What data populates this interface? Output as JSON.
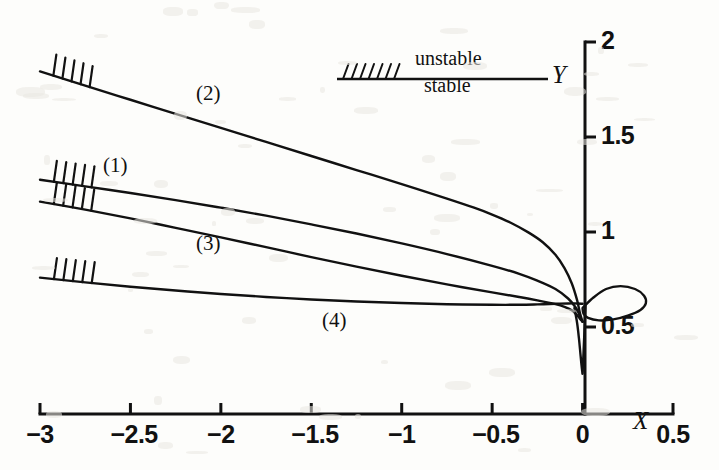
{
  "figure": {
    "background_color": "#fdfdfb",
    "ink_color": "#111111",
    "axis_labels": {
      "x": "X",
      "y": "Y"
    }
  },
  "legend": {
    "unstable_label": "unstable",
    "stable_label": "stable",
    "hatch_marks": 7
  },
  "curve_labels": [
    {
      "text": "(1)",
      "x": 103,
      "y": 155
    },
    {
      "text": "(2)",
      "x": 196,
      "y": 83
    },
    {
      "text": "(3)",
      "x": 196,
      "y": 233
    },
    {
      "text": "(4)",
      "x": 322,
      "y": 310
    }
  ],
  "chart_data": {
    "type": "line",
    "title": "",
    "xlabel": "X",
    "ylabel": "Y",
    "xlim": [
      -3,
      0.5
    ],
    "ylim": [
      0,
      2
    ],
    "xticks": [
      -3,
      -2.5,
      -2,
      -1.5,
      -1,
      -0.5,
      0,
      0.5
    ],
    "xtick_labels": [
      "-3",
      "-2.5",
      "-2",
      "-1.5",
      "-1",
      "-0.5",
      "0",
      "0.5"
    ],
    "yticks": [
      0.5,
      1,
      1.5,
      2
    ],
    "ytick_labels": [
      "0.5",
      "1",
      "1.5",
      "2"
    ],
    "grid": false,
    "legend_position": "top-center",
    "stability_encoding": {
      "unstable": "line with hatch ticks",
      "stable": "plain line"
    },
    "series": [
      {
        "name": "(1)",
        "stability": "unstable-at-left",
        "unstable_range_x": [
          -3.0,
          -2.72
        ],
        "points": [
          [
            -3.0,
            1.275
          ],
          [
            -2.75,
            1.24
          ],
          [
            -2.5,
            1.205
          ],
          [
            -2.25,
            1.168
          ],
          [
            -2.0,
            1.128
          ],
          [
            -1.75,
            1.086
          ],
          [
            -1.5,
            1.04
          ],
          [
            -1.25,
            0.992
          ],
          [
            -1.0,
            0.94
          ],
          [
            -0.75,
            0.884
          ],
          [
            -0.5,
            0.822
          ],
          [
            -0.35,
            0.78
          ],
          [
            -0.25,
            0.744
          ],
          [
            -0.15,
            0.7
          ],
          [
            -0.08,
            0.65
          ],
          [
            -0.04,
            0.605
          ],
          [
            -0.02,
            0.57
          ],
          [
            -0.01,
            0.545
          ],
          [
            0.0,
            0.528
          ]
        ]
      },
      {
        "name": "(2)",
        "stability": "unstable-at-left",
        "unstable_range_x": [
          -3.0,
          -2.7
        ],
        "points": [
          [
            -3.0,
            1.845
          ],
          [
            -2.75,
            1.77
          ],
          [
            -2.5,
            1.696
          ],
          [
            -2.25,
            1.622
          ],
          [
            -2.0,
            1.548
          ],
          [
            -1.75,
            1.474
          ],
          [
            -1.5,
            1.4
          ],
          [
            -1.25,
            1.326
          ],
          [
            -1.0,
            1.252
          ],
          [
            -0.75,
            1.176
          ],
          [
            -0.6,
            1.128
          ],
          [
            -0.5,
            1.092
          ],
          [
            -0.4,
            1.05
          ],
          [
            -0.3,
            0.998
          ],
          [
            -0.22,
            0.946
          ],
          [
            -0.15,
            0.88
          ],
          [
            -0.1,
            0.81
          ],
          [
            -0.06,
            0.73
          ],
          [
            -0.03,
            0.64
          ],
          [
            -0.015,
            0.575
          ],
          [
            0.0,
            0.528
          ]
        ]
      },
      {
        "name": "(3)",
        "stability": "unstable-at-left",
        "unstable_range_x": [
          -3.0,
          -2.7
        ],
        "points": [
          [
            -3.0,
            1.16
          ],
          [
            -2.75,
            1.118
          ],
          [
            -2.5,
            1.072
          ],
          [
            -2.25,
            1.022
          ],
          [
            -2.0,
            0.972
          ],
          [
            -1.75,
            0.92
          ],
          [
            -1.5,
            0.868
          ],
          [
            -1.25,
            0.818
          ],
          [
            -1.0,
            0.77
          ],
          [
            -0.75,
            0.724
          ],
          [
            -0.5,
            0.682
          ],
          [
            -0.35,
            0.658
          ],
          [
            -0.25,
            0.64
          ],
          [
            -0.15,
            0.62
          ],
          [
            -0.1,
            0.606
          ],
          [
            -0.06,
            0.588
          ],
          [
            -0.03,
            0.562
          ],
          [
            -0.015,
            0.544
          ],
          [
            0.0,
            0.528
          ]
        ]
      },
      {
        "name": "(4)",
        "stability": "unstable-at-left",
        "unstable_range_x": [
          -3.0,
          -2.7
        ],
        "points": [
          [
            -3.0,
            0.76
          ],
          [
            -2.75,
            0.735
          ],
          [
            -2.5,
            0.712
          ],
          [
            -2.25,
            0.692
          ],
          [
            -2.0,
            0.674
          ],
          [
            -1.75,
            0.658
          ],
          [
            -1.5,
            0.645
          ],
          [
            -1.25,
            0.634
          ],
          [
            -1.0,
            0.626
          ],
          [
            -0.75,
            0.62
          ],
          [
            -0.5,
            0.617
          ],
          [
            -0.35,
            0.617
          ],
          [
            -0.25,
            0.619
          ],
          [
            -0.15,
            0.622
          ],
          [
            -0.08,
            0.624
          ],
          [
            -0.03,
            0.624
          ],
          [
            0.0,
            0.622
          ]
        ]
      },
      {
        "name": "cusp",
        "stability": "stable",
        "description": "narrow downward spike along the Y axis from the convergence point",
        "points": [
          [
            -0.045,
            0.6
          ],
          [
            -0.03,
            0.52
          ],
          [
            -0.02,
            0.44
          ],
          [
            -0.012,
            0.36
          ],
          [
            -0.006,
            0.3
          ],
          [
            -0.002,
            0.268
          ],
          [
            0.0,
            0.255
          ],
          [
            0.002,
            0.3
          ],
          [
            0.006,
            0.38
          ],
          [
            0.01,
            0.47
          ],
          [
            0.014,
            0.56
          ],
          [
            0.016,
            0.61
          ]
        ]
      },
      {
        "name": "loop",
        "stability": "stable",
        "description": "closed teardrop loop right of the Y axis",
        "points": [
          [
            0.0,
            0.6
          ],
          [
            0.06,
            0.655
          ],
          [
            0.13,
            0.7
          ],
          [
            0.21,
            0.715
          ],
          [
            0.29,
            0.7
          ],
          [
            0.34,
            0.665
          ],
          [
            0.35,
            0.625
          ],
          [
            0.32,
            0.59
          ],
          [
            0.25,
            0.56
          ],
          [
            0.17,
            0.54
          ],
          [
            0.09,
            0.535
          ],
          [
            0.03,
            0.548
          ],
          [
            0.005,
            0.57
          ],
          [
            0.0,
            0.6
          ]
        ]
      }
    ]
  }
}
